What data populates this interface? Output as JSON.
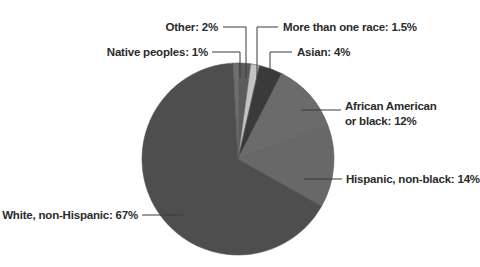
{
  "chart_data": {
    "type": "pie",
    "title": "",
    "note": "Labeled percentages sum to 101.5% (rounding in source); wedges are drawn normalized to the total.",
    "slices": [
      {
        "label": "Native peoples: 1%",
        "name": "Native peoples",
        "value": 1,
        "color": "#6e6e6e"
      },
      {
        "label": "Other: 2%",
        "name": "Other",
        "value": 2,
        "color": "#5c5c5c"
      },
      {
        "label": "More than one race: 1.5%",
        "name": "More than one race",
        "value": 1.5,
        "color": "#c4c4c4"
      },
      {
        "label": "Asian: 4%",
        "name": "Asian",
        "value": 4,
        "color": "#3a3a3a"
      },
      {
        "label": "African American or black: 12%",
        "name": "African American or black",
        "value": 12,
        "color": "#6b6b6b"
      },
      {
        "label": "Hispanic, non-black: 14%",
        "name": "Hispanic, non-black",
        "value": 14,
        "color": "#686868"
      },
      {
        "label": "White, non-Hispanic: 67%",
        "name": "White, non-Hispanic",
        "value": 67,
        "color": "#4e4e4e"
      }
    ],
    "start_angle_deg": 0,
    "direction": "clockwise",
    "legend": "none (direct labels with leader lines)"
  },
  "labels": {
    "native": "Native peoples: 1%",
    "other": "Other: 2%",
    "multi": "More than one race: 1.5%",
    "asian": "Asian: 4%",
    "african_line1": "African American",
    "african_line2": "or black: 12%",
    "hispanic": "Hispanic, non-black: 14%",
    "white": "White, non-Hispanic: 67%"
  }
}
